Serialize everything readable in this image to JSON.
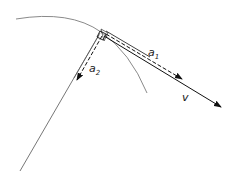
{
  "diagram": {
    "type": "physics-vector-diagram",
    "colors": {
      "arc": "#888888",
      "lines": "#111111",
      "normal_line": "#777777"
    },
    "labels": {
      "a1": {
        "symbol": "a",
        "subscript": "1"
      },
      "a2": {
        "symbol": "a",
        "subscript": "2"
      },
      "v": {
        "symbol": "v"
      }
    },
    "elements": [
      {
        "name": "trajectory-arc",
        "kind": "curve"
      },
      {
        "name": "normal-line",
        "kind": "line"
      },
      {
        "name": "velocity-vector",
        "kind": "arrow",
        "label": "v"
      },
      {
        "name": "tangential-acceleration",
        "kind": "dashed-arrow",
        "label": "a1"
      },
      {
        "name": "normal-acceleration",
        "kind": "dashed-arrow",
        "label": "a2"
      },
      {
        "name": "right-angle-marker",
        "kind": "square"
      }
    ]
  }
}
